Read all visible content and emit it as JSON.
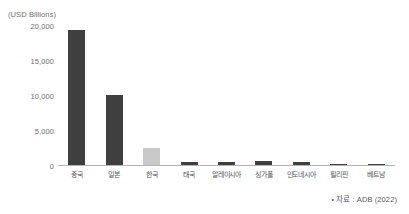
{
  "chart_data": {
    "type": "bar",
    "title": "",
    "subtitle": "",
    "xlabel": "",
    "ylabel": "(USD Billions)",
    "unit_caption": "(USD Billions)",
    "ylim": [
      0,
      20000
    ],
    "grid": false,
    "legend": "none",
    "ytick_labels": [
      "20,000",
      "15,000",
      "10,000",
      "5,000",
      "0"
    ],
    "ytick_values": [
      20000,
      15000,
      10000,
      5000,
      0
    ],
    "categories": [
      "중국",
      "일본",
      "한국",
      "태국",
      "말레이시아",
      "싱가폴",
      "인도네시아",
      "필리핀",
      "베트남"
    ],
    "values": [
      19400,
      10100,
      2600,
      620,
      600,
      700,
      630,
      250,
      310
    ],
    "bar_colors": [
      "#3f3f3f",
      "#3f3f3f",
      "#c9c9c9",
      "#3f3f3f",
      "#3f3f3f",
      "#3f3f3f",
      "#3f3f3f",
      "#3f3f3f",
      "#3f3f3f"
    ],
    "highlight_category": "한국",
    "accent_color": "#3f3f3f",
    "highlight_color": "#c9c9c9",
    "axis_color": "#b4b4b4",
    "text_color": "#6d6d6d"
  },
  "source": {
    "bullet": "•",
    "text": "자료 : ADB (2022)"
  }
}
